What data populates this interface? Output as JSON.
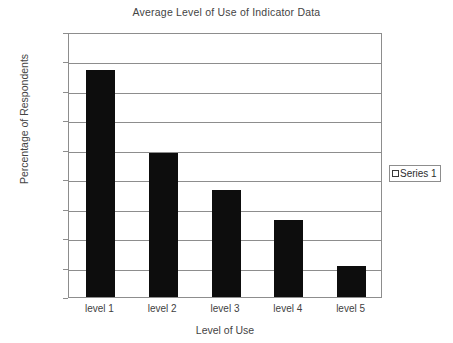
{
  "chart_data": {
    "type": "bar",
    "title": "Average Level of Use of Indicator Data",
    "xlabel": "Level of Use",
    "ylabel": "Percentage of Respondents",
    "categories": [
      "level 1",
      "level 2",
      "level 3",
      "level 4",
      "level 5"
    ],
    "values": [
      38.5,
      24.4,
      18.1,
      13.0,
      5.3
    ],
    "ylim": [
      0,
      45
    ],
    "ytick_values": [
      0,
      5,
      10,
      15,
      20,
      25,
      30,
      35,
      40,
      45
    ],
    "ytick_labels": [
      "0%",
      "5%",
      "10%",
      "15%",
      "20%",
      "25%",
      "30%",
      "35%",
      "40%",
      "45%"
    ],
    "grid": true,
    "grid_axis": "y",
    "legend": {
      "position": "right",
      "entries": [
        {
          "label": "Series 1",
          "marker": "square-outline",
          "color": "#000000"
        }
      ]
    },
    "bar_color": "#0d0d0d",
    "axis_color": "#8d8d8d",
    "background": "#ffffff"
  }
}
